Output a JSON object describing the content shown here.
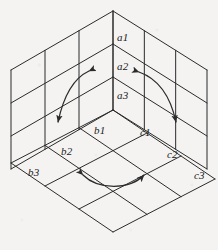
{
  "figure": {
    "name": "isometric-corner-grid",
    "background_color": "#f4f3f2",
    "line_color": "#2b2b2b",
    "label_color": "#1a1a1a",
    "grid_divisions": 3
  },
  "labels": {
    "a": [
      {
        "text": "a1",
        "x": 117,
        "y": 32
      },
      {
        "text": "a2",
        "x": 117,
        "y": 61
      },
      {
        "text": "a3",
        "x": 117,
        "y": 90
      }
    ],
    "b": [
      {
        "text": "b1",
        "x": 94,
        "y": 125
      },
      {
        "text": "b2",
        "x": 61,
        "y": 146
      },
      {
        "text": "b3",
        "x": 28,
        "y": 167
      }
    ],
    "c": [
      {
        "text": "c1",
        "x": 140,
        "y": 127
      },
      {
        "text": "c2",
        "x": 167,
        "y": 149
      },
      {
        "text": "c3",
        "x": 194,
        "y": 170
      }
    ]
  },
  "faces": [
    {
      "name": "left-wall",
      "label_group": "none"
    },
    {
      "name": "right-wall",
      "label_group": "a"
    },
    {
      "name": "floor",
      "label_group": "b-and-c"
    }
  ],
  "arrows": [
    {
      "name": "left-wall-arrow",
      "style": "double-headed-curve",
      "path": "M 89,71 C 74,78 64,94 58,122",
      "head_start": {
        "x": 89,
        "y": 71,
        "angle": -24
      },
      "head_end": {
        "x": 57,
        "y": 126,
        "angle": 100
      }
    },
    {
      "name": "right-wall-arrow",
      "style": "double-headed-curve",
      "path": "M 139,72 C 156,78 170,94 176,122",
      "head_start": {
        "x": 139,
        "y": 72,
        "angle": -160
      },
      "head_end": {
        "x": 177,
        "y": 126,
        "angle": 80
      }
    },
    {
      "name": "floor-arrow",
      "style": "double-headed-curve",
      "path": "M 83,175 C 98,190 130,190 144,175",
      "head_start": {
        "x": 82,
        "y": 174,
        "angle": -135
      },
      "head_end": {
        "x": 145,
        "y": 174,
        "angle": -45
      }
    }
  ],
  "geometry": {
    "top_apex": {
      "x": 113,
      "y": 11
    },
    "center_vertex": {
      "x": 113,
      "y": 110
    },
    "left_vertex": {
      "x": 11,
      "y": 70
    },
    "right_vertex": {
      "x": 207,
      "y": 70
    },
    "left_bottom": {
      "x": 11,
      "y": 163
    },
    "right_bottom": {
      "x": 207,
      "y": 163
    },
    "bottom_apex": {
      "x": 113,
      "y": 232
    }
  }
}
